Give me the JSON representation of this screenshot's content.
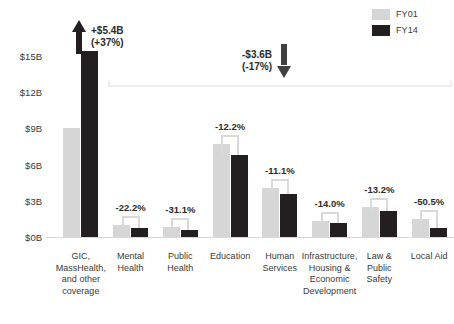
{
  "chart_data": {
    "type": "bar",
    "title": "",
    "xlabel": "",
    "ylabel": "",
    "ylim": [
      0,
      16.2
    ],
    "grid": false,
    "legend_position": "top-right",
    "ytick_labels": [
      "$15B",
      "$12B",
      "$9B",
      "$6B",
      "$3B",
      "$0B"
    ],
    "ytick_values": [
      15,
      12,
      9,
      6,
      3,
      0
    ],
    "categories": [
      "GIC, MassHealth, and other coverage",
      "Mental Health",
      "Public Health",
      "Education",
      "Human Services",
      "Infrastructure, Housing & Economic Development",
      "Law & Public Safety",
      "Local Aid"
    ],
    "series": [
      {
        "name": "FY01",
        "color": "#d6d6d6",
        "values": [
          9.0,
          1.0,
          0.86,
          7.7,
          4.05,
          1.32,
          2.5,
          1.5
        ]
      },
      {
        "name": "FY14",
        "color": "#231f20",
        "values": [
          15.4,
          0.78,
          0.59,
          6.76,
          3.6,
          1.14,
          2.17,
          0.74
        ]
      }
    ],
    "data_labels": [
      "",
      "-22.2%",
      "-31.1%",
      "-12.2%",
      "-11.1%",
      "-14.0%",
      "-13.2%",
      "-50.5%"
    ],
    "annotations": [
      {
        "name": "increase-callout",
        "line1": "+$5.4B",
        "line2": "(+37%)",
        "direction": "up"
      },
      {
        "name": "decrease-callout",
        "line1": "-$3.6B",
        "line2": "(-17%)",
        "direction": "down"
      }
    ]
  },
  "legend": {
    "items": [
      {
        "label": "FY01",
        "color": "#d6d6d6"
      },
      {
        "label": "FY14",
        "color": "#231f20"
      }
    ]
  },
  "category_label_lines": [
    [
      "GIC,",
      "MassHealth,",
      "and other",
      "coverage"
    ],
    [
      "Mental",
      "Health"
    ],
    [
      "Public",
      "Health"
    ],
    [
      "Education"
    ],
    [
      "Human",
      "Services"
    ],
    [
      "Infrastructure,",
      "Housing &",
      "Economic",
      "Development"
    ],
    [
      "Law &",
      "Public",
      "Safety"
    ],
    [
      "Local Aid"
    ]
  ]
}
